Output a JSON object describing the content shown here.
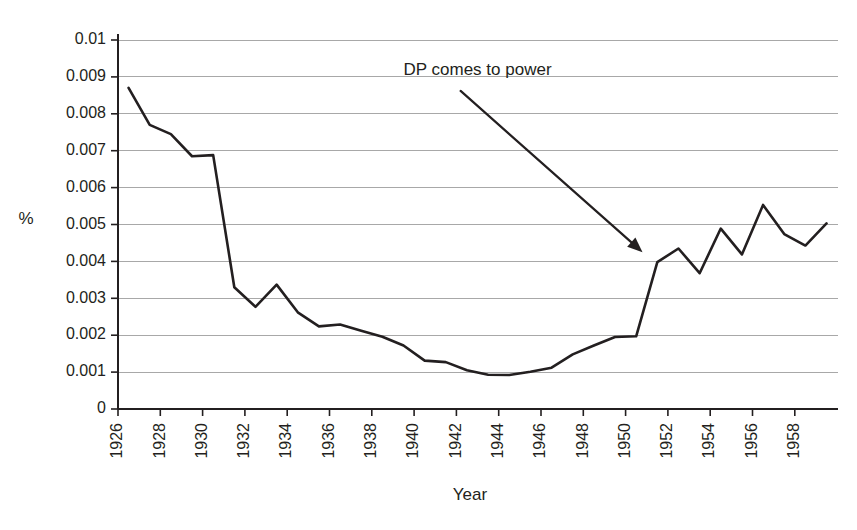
{
  "chart_data": {
    "type": "line",
    "title": "",
    "xlabel": "Year",
    "ylabel": "%",
    "xlim": [
      1926,
      1959
    ],
    "ylim": [
      0,
      0.01
    ],
    "grid": true,
    "legend": "none",
    "x_tick_labels": [
      "1926",
      "1928",
      "1930",
      "1932",
      "1934",
      "1936",
      "1938",
      "1940",
      "1942",
      "1944",
      "1946",
      "1948",
      "1950",
      "1952",
      "1954",
      "1956",
      "1958"
    ],
    "x_ticks": [
      1926,
      1928,
      1930,
      1932,
      1934,
      1936,
      1938,
      1940,
      1942,
      1944,
      1946,
      1948,
      1950,
      1952,
      1954,
      1956,
      1958
    ],
    "y_tick_labels": [
      "0",
      "0.001",
      "0.002",
      "0.003",
      "0.004",
      "0.005",
      "0.006",
      "0.007",
      "0.008",
      "0.009",
      "0.01"
    ],
    "y_ticks": [
      0,
      0.001,
      0.002,
      0.003,
      0.004,
      0.005,
      0.006,
      0.007,
      0.008,
      0.009,
      0.01
    ],
    "x": [
      1926,
      1927,
      1928,
      1929,
      1930,
      1931,
      1932,
      1933,
      1934,
      1935,
      1936,
      1937,
      1938,
      1939,
      1940,
      1941,
      1942,
      1943,
      1944,
      1945,
      1946,
      1947,
      1948,
      1949,
      1950,
      1951,
      1952,
      1953,
      1954,
      1955,
      1956,
      1957,
      1958,
      1959
    ],
    "values": [
      0.0087,
      0.0077,
      0.00745,
      0.00685,
      0.00688,
      0.0033,
      0.00277,
      0.00337,
      0.00262,
      0.00224,
      0.00229,
      0.00212,
      0.00196,
      0.00172,
      0.00131,
      0.00127,
      0.00105,
      0.00093,
      0.00092,
      0.00101,
      0.00112,
      0.00148,
      0.00172,
      0.00195,
      0.00197,
      0.00398,
      0.00435,
      0.00368,
      0.00489,
      0.00419,
      0.00553,
      0.00474,
      0.00443,
      0.00503
    ],
    "series_color": "#231f20",
    "grid_color": "#a8a8a8",
    "annotations": [
      {
        "text": "DP comes to power",
        "text_x": 1939.5,
        "text_y": 0.00905,
        "arrow_from_x": 1942.2,
        "arrow_from_y": 0.00862,
        "arrow_to_x": 1950.8,
        "arrow_to_y": 0.00425
      }
    ]
  }
}
